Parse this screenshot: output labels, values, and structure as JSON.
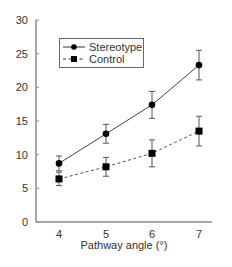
{
  "chart_data": {
    "type": "line",
    "title": "",
    "xlabel": "Pathway angle (°)",
    "ylabel": "",
    "x": [
      4,
      5,
      6,
      7
    ],
    "xticks": [
      "4",
      "5",
      "6",
      "7"
    ],
    "yticks": [
      "0",
      "5",
      "10",
      "15",
      "20",
      "25",
      "30"
    ],
    "ylim": [
      0,
      30
    ],
    "grid": false,
    "legend_position": "upper left",
    "series": [
      {
        "name": "Stereotype",
        "values": [
          8.7,
          13.1,
          17.4,
          23.3
        ],
        "errors": [
          1.1,
          1.4,
          2.0,
          2.2
        ],
        "line_style": "solid",
        "marker": "circle",
        "color": "#000000"
      },
      {
        "name": "Control",
        "values": [
          6.4,
          8.2,
          10.2,
          13.5
        ],
        "errors": [
          1.0,
          1.4,
          2.0,
          2.2
        ],
        "line_style": "dashed",
        "marker": "square",
        "color": "#000000"
      }
    ]
  }
}
